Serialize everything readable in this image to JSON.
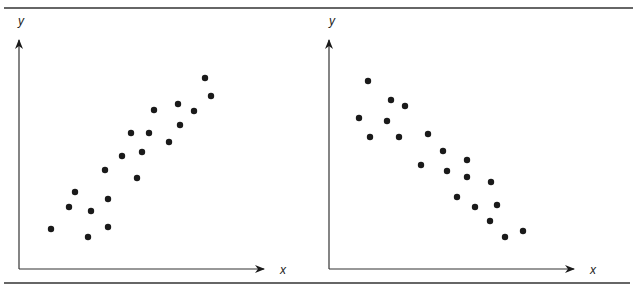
{
  "chart_data": [
    {
      "type": "scatter",
      "title": "",
      "xlabel": "x",
      "ylabel": "y",
      "grid": false,
      "legend": null,
      "description": "Positive correlation",
      "points": [
        {
          "x": 51,
          "y": 229
        },
        {
          "x": 69,
          "y": 207
        },
        {
          "x": 75,
          "y": 192
        },
        {
          "x": 91,
          "y": 211
        },
        {
          "x": 88,
          "y": 237
        },
        {
          "x": 108,
          "y": 199
        },
        {
          "x": 108,
          "y": 227
        },
        {
          "x": 105,
          "y": 170
        },
        {
          "x": 137,
          "y": 178
        },
        {
          "x": 122,
          "y": 156
        },
        {
          "x": 142,
          "y": 152
        },
        {
          "x": 131,
          "y": 133
        },
        {
          "x": 149,
          "y": 133
        },
        {
          "x": 169,
          "y": 142
        },
        {
          "x": 154,
          "y": 110
        },
        {
          "x": 180,
          "y": 125
        },
        {
          "x": 178,
          "y": 104
        },
        {
          "x": 194,
          "y": 111
        },
        {
          "x": 205,
          "y": 78
        },
        {
          "x": 211,
          "y": 96
        }
      ]
    },
    {
      "type": "scatter",
      "title": "",
      "xlabel": "x",
      "ylabel": "y",
      "grid": false,
      "legend": null,
      "description": "Negative correlation",
      "points": [
        {
          "x": 368,
          "y": 81
        },
        {
          "x": 391,
          "y": 100
        },
        {
          "x": 405,
          "y": 106
        },
        {
          "x": 359,
          "y": 118
        },
        {
          "x": 387,
          "y": 121
        },
        {
          "x": 370,
          "y": 137
        },
        {
          "x": 399,
          "y": 137
        },
        {
          "x": 428,
          "y": 134
        },
        {
          "x": 443,
          "y": 151
        },
        {
          "x": 467,
          "y": 160
        },
        {
          "x": 421,
          "y": 165
        },
        {
          "x": 447,
          "y": 171
        },
        {
          "x": 467,
          "y": 177
        },
        {
          "x": 491,
          "y": 182
        },
        {
          "x": 457,
          "y": 197
        },
        {
          "x": 475,
          "y": 207
        },
        {
          "x": 497,
          "y": 205
        },
        {
          "x": 490,
          "y": 221
        },
        {
          "x": 505,
          "y": 237
        },
        {
          "x": 523,
          "y": 231
        }
      ]
    }
  ],
  "labels": {
    "left_x": "x",
    "left_y": "y",
    "right_x": "x",
    "right_y": "y"
  },
  "colors": {
    "ink": "#1a1a1a",
    "rule": "#333333"
  }
}
